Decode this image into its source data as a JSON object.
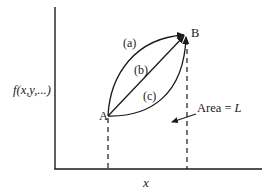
{
  "diagram": {
    "colors": {
      "line": "#1a1a1a",
      "background": "#ffffff"
    },
    "axes": {
      "y_label": "f(x,y,...)",
      "x_label": "x"
    },
    "points": [
      {
        "id": "A",
        "label": "A"
      },
      {
        "id": "B",
        "label": "B"
      }
    ],
    "paths": [
      {
        "id": "a",
        "label": "(a)",
        "shape": "curve above straight line"
      },
      {
        "id": "b",
        "label": "(b)",
        "shape": "straight line"
      },
      {
        "id": "c",
        "label": "(c)",
        "shape": "curve below straight line"
      }
    ],
    "annotation": {
      "text_prefix": "Area = ",
      "text_var": "L"
    }
  }
}
